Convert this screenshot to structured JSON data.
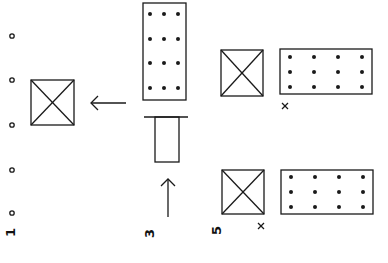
{
  "labels": {
    "panel1": "1",
    "panel3": "3",
    "panel5": "5"
  },
  "markers": {
    "cross_top": "×",
    "cross_bottom": "×"
  },
  "colors": {
    "ink": "#1a1a1a",
    "background": "#ffffff"
  }
}
